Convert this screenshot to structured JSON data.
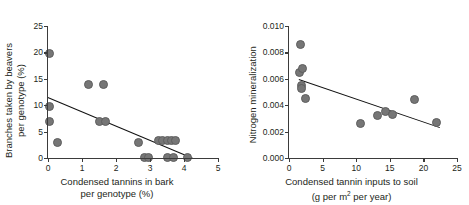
{
  "figure": {
    "panels": [
      "left",
      "right"
    ]
  },
  "chart_data": [
    {
      "panel": "left",
      "type": "scatter",
      "title": "",
      "xlabel_line1": "Condensed tannins in bark",
      "xlabel_line2": "per genotype (%)",
      "ylabel_line1": "Branches taken by beavers",
      "ylabel_line2": "per genotype (%)",
      "xlim": [
        0,
        5
      ],
      "ylim": [
        0,
        25
      ],
      "xticks": [
        0,
        1,
        2,
        3,
        4,
        5
      ],
      "yticks": [
        0,
        5,
        10,
        15,
        20,
        25
      ],
      "xticklabels": [
        "0",
        "1",
        "2",
        "3",
        "4",
        "5"
      ],
      "yticklabels": [
        "0",
        "5",
        "10",
        "15",
        "20",
        "25"
      ],
      "grid": false,
      "legend": "none",
      "points": [
        {
          "x": 0.04,
          "y": 19.8
        },
        {
          "x": 0.05,
          "y": 9.8
        },
        {
          "x": 0.04,
          "y": 6.9
        },
        {
          "x": 0.27,
          "y": 2.9
        },
        {
          "x": 1.18,
          "y": 14.0
        },
        {
          "x": 1.63,
          "y": 14.0
        },
        {
          "x": 1.52,
          "y": 6.9
        },
        {
          "x": 1.68,
          "y": 6.9
        },
        {
          "x": 2.65,
          "y": 2.9
        },
        {
          "x": 2.85,
          "y": 0.1
        },
        {
          "x": 2.97,
          "y": 0.1
        },
        {
          "x": 3.24,
          "y": 3.3
        },
        {
          "x": 3.38,
          "y": 3.3
        },
        {
          "x": 3.5,
          "y": 3.3
        },
        {
          "x": 3.62,
          "y": 3.3
        },
        {
          "x": 3.76,
          "y": 3.3
        },
        {
          "x": 3.5,
          "y": 0.1
        },
        {
          "x": 3.68,
          "y": 0.1
        },
        {
          "x": 4.1,
          "y": 0.1
        }
      ],
      "trendline": {
        "x1": 0.0,
        "y1": 11.5,
        "x2": 4.25,
        "y2": 0.0
      }
    },
    {
      "panel": "right",
      "type": "scatter",
      "title": "",
      "xlabel_line1": "Condensed tannin inputs to soil",
      "xlabel_line2_pre": "(g per m",
      "xlabel_line2_sup": "2",
      "xlabel_line2_post": " per year)",
      "ylabel_line1": "Nitrogen mineralization",
      "xlim": [
        0,
        25
      ],
      "ylim": [
        0,
        0.01
      ],
      "xticks": [
        0,
        5,
        10,
        15,
        20,
        25
      ],
      "yticks": [
        0,
        0.002,
        0.004,
        0.006,
        0.008,
        0.01
      ],
      "xticklabels": [
        "0",
        "5",
        "10",
        "15",
        "20",
        "25"
      ],
      "yticklabels": [
        "0.000",
        "0.002",
        "0.004",
        "0.006",
        "0.008",
        "0.010"
      ],
      "grid": false,
      "legend": "none",
      "points": [
        {
          "x": 1.7,
          "y": 0.0086
        },
        {
          "x": 1.5,
          "y": 0.0065
        },
        {
          "x": 2.0,
          "y": 0.0068
        },
        {
          "x": 1.8,
          "y": 0.0055
        },
        {
          "x": 1.9,
          "y": 0.0053
        },
        {
          "x": 2.4,
          "y": 0.0045
        },
        {
          "x": 10.6,
          "y": 0.0026
        },
        {
          "x": 13.2,
          "y": 0.0032
        },
        {
          "x": 14.3,
          "y": 0.0035
        },
        {
          "x": 15.4,
          "y": 0.0033
        },
        {
          "x": 18.7,
          "y": 0.0044
        },
        {
          "x": 21.9,
          "y": 0.0027
        }
      ],
      "trendline": {
        "x1": 1.5,
        "y1": 0.006,
        "x2": 22.5,
        "y2": 0.00235
      }
    }
  ],
  "colors": {
    "marker_fill": "#767676",
    "marker_stroke": "#5e5e5e",
    "trendline": "#111111",
    "axis": "#3b3b3b",
    "text": "#231f20",
    "background": "#ffffff"
  }
}
